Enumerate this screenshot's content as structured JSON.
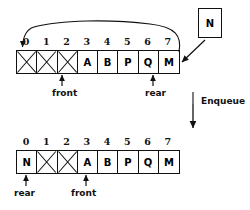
{
  "diagram": {
    "operation_label": "Enqueue",
    "incoming_element": "N",
    "top_array": {
      "indices": [
        "0",
        "1",
        "2",
        "3",
        "4",
        "5",
        "6",
        "7"
      ],
      "cells": [
        {
          "index": "0",
          "value": "",
          "empty": true
        },
        {
          "index": "1",
          "value": "",
          "empty": true
        },
        {
          "index": "2",
          "value": "",
          "empty": true
        },
        {
          "index": "3",
          "value": "A",
          "empty": false
        },
        {
          "index": "4",
          "value": "B",
          "empty": false
        },
        {
          "index": "5",
          "value": "P",
          "empty": false
        },
        {
          "index": "6",
          "value": "Q",
          "empty": false
        },
        {
          "index": "7",
          "value": "M",
          "empty": false
        }
      ],
      "front_label": "front",
      "front_index": 3,
      "rear_label": "rear",
      "rear_index": 7
    },
    "bottom_array": {
      "indices": [
        "0",
        "1",
        "2",
        "3",
        "4",
        "5",
        "6",
        "7"
      ],
      "cells": [
        {
          "index": "0",
          "value": "N",
          "empty": false
        },
        {
          "index": "1",
          "value": "",
          "empty": true
        },
        {
          "index": "2",
          "value": "",
          "empty": true
        },
        {
          "index": "3",
          "value": "A",
          "empty": false
        },
        {
          "index": "4",
          "value": "B",
          "empty": false
        },
        {
          "index": "5",
          "value": "P",
          "empty": false
        },
        {
          "index": "6",
          "value": "Q",
          "empty": false
        },
        {
          "index": "7",
          "value": "M",
          "empty": false
        }
      ],
      "rear_label": "rear",
      "rear_index": 0,
      "front_label": "front",
      "front_index": 3
    },
    "colors": {
      "stroke": "#111111",
      "background": "#ffffff",
      "text": "#000000"
    }
  }
}
